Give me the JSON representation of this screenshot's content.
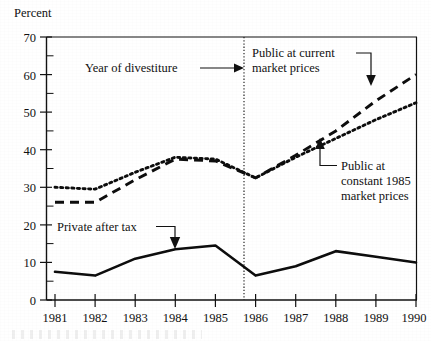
{
  "chart_data": {
    "type": "line",
    "title": "",
    "subtitle": "",
    "ylabel": "Percent",
    "xlabel": "",
    "x": [
      1981,
      1982,
      1983,
      1984,
      1985,
      1986,
      1987,
      1988,
      1989,
      1990
    ],
    "categories": [
      "1981",
      "1982",
      "1983",
      "1984",
      "1985",
      "1986",
      "1987",
      "1988",
      "1989",
      "1990"
    ],
    "xlim": [
      1981,
      1990
    ],
    "ylim": [
      0,
      70
    ],
    "y_major_ticks": [
      0,
      10,
      20,
      30,
      40,
      50,
      60,
      70
    ],
    "y_major_tick_labels": [
      "0",
      "10",
      "20",
      "30",
      "40",
      "50",
      "60",
      "70"
    ],
    "y_minor_ticks": [
      5,
      15,
      25,
      35,
      45,
      55,
      65
    ],
    "grid": false,
    "legend": "inline-annotations",
    "series": [
      {
        "name": "Public at current market prices",
        "style": "dashed",
        "values": [
          26.0,
          26.0,
          32.0,
          37.5,
          37.0,
          32.5,
          38.5,
          45.0,
          53.0,
          60.0
        ]
      },
      {
        "name": "Public at constant 1985 market prices",
        "style": "dotted",
        "values": [
          30.0,
          29.5,
          34.0,
          38.0,
          37.5,
          32.5,
          38.0,
          43.0,
          48.0,
          52.5
        ]
      },
      {
        "name": "Private after tax",
        "style": "solid",
        "values": [
          7.5,
          6.5,
          11.0,
          13.5,
          14.5,
          6.5,
          9.0,
          13.0,
          11.5,
          10.0
        ]
      }
    ],
    "annotations": [
      {
        "id": "divestiture",
        "text": "Year of divestiture",
        "text_lines": [
          "Year of divestiture"
        ],
        "points_to_x": 1985.72,
        "marker": "vertical-dotted-line"
      },
      {
        "id": "public-current",
        "text": "Public at current market prices",
        "text_lines": [
          "Public at current",
          "market prices"
        ],
        "points_to_x": 1989.0,
        "points_to_y": 53.0
      },
      {
        "id": "public-constant",
        "text": "Public at constant 1985 market prices",
        "text_lines": [
          "Public at",
          "constant 1985",
          "market prices"
        ],
        "points_to_x": 1988.0,
        "points_to_y": 43.0
      },
      {
        "id": "private-after-tax",
        "text": "Private after tax",
        "text_lines": [
          "Private after tax"
        ],
        "points_to_x": 1984.0,
        "points_to_y": 13.5
      }
    ],
    "colors": {
      "ink": "#111111",
      "background": "#ffffff"
    }
  },
  "axis": {
    "y_title": "Percent",
    "y_labels": [
      "70",
      "60",
      "50",
      "40",
      "30",
      "20",
      "10",
      "0"
    ],
    "x_labels": [
      "1981",
      "1982",
      "1983",
      "1984",
      "1985",
      "1986",
      "1987",
      "1988",
      "1989",
      "1990"
    ]
  },
  "annotations": {
    "divestiture": "Year of divestiture",
    "public_current_l1": "Public at current",
    "public_current_l2": "market prices",
    "public_constant_l1": "Public at",
    "public_constant_l2": "constant 1985",
    "public_constant_l3": "market prices",
    "private_after_tax": "Private after tax"
  }
}
